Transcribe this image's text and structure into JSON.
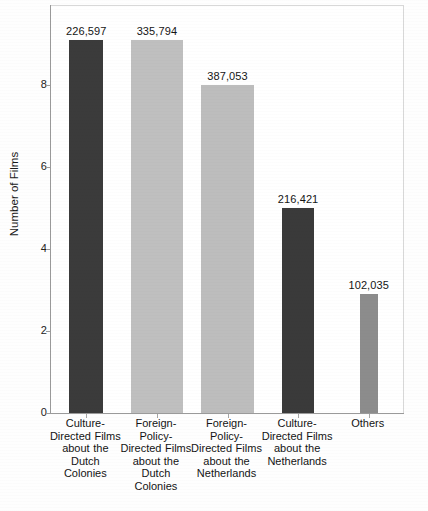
{
  "chart_data": {
    "type": "bar",
    "title": "",
    "xlabel": "",
    "ylabel": "Number of Films",
    "ylim": [
      0,
      9.95
    ],
    "yticks": [
      0,
      2,
      4,
      6,
      8
    ],
    "grid": false,
    "legend": null,
    "categories": [
      "Culture-Directed Films about the Dutch Colonies",
      "Foreign-Policy-Directed Films about the Dutch Colonies",
      "Foreign-Policy-Directed Films about the Netherlands",
      "Culture-Directed Films about the Netherlands",
      "Others"
    ],
    "values": [
      9.1,
      9.1,
      8,
      5,
      2.9
    ],
    "data_labels": [
      "226,597",
      "335,794",
      "387,053",
      "216,421",
      "102,035"
    ],
    "bar_colors": [
      "#3b3b3b",
      "#bfbfbf",
      "#bdbdbd",
      "#3a3a3a",
      "#8c8c8c"
    ]
  },
  "axis": {
    "y_title": "Number of Films",
    "y_ticks": [
      "0",
      "2",
      "4",
      "6",
      "8"
    ]
  },
  "bars": [
    {
      "label_lines": [
        "Culture-",
        "Directed Films",
        "about the",
        "Dutch",
        "Colonies"
      ],
      "value_label": "226,597",
      "value": 9.1,
      "color": "#3b3b3b"
    },
    {
      "label_lines": [
        "Foreign-",
        "Policy-",
        "Directed Films",
        "about the",
        "Dutch",
        "Colonies"
      ],
      "value_label": "335,794",
      "value": 9.1,
      "color": "#bfbfbf"
    },
    {
      "label_lines": [
        "Foreign-",
        "Policy-",
        "Directed Films",
        "about the",
        "Netherlands"
      ],
      "value_label": "387,053",
      "value": 8,
      "color": "#bdbdbd"
    },
    {
      "label_lines": [
        "Culture-",
        "Directed Films",
        "about the",
        "Netherlands"
      ],
      "value_label": "216,421",
      "value": 5,
      "color": "#3a3a3a"
    },
    {
      "label_lines": [
        "Others"
      ],
      "value_label": "102,035",
      "value": 2.9,
      "color": "#8c8c8c"
    }
  ],
  "caption": {
    "text": ""
  }
}
